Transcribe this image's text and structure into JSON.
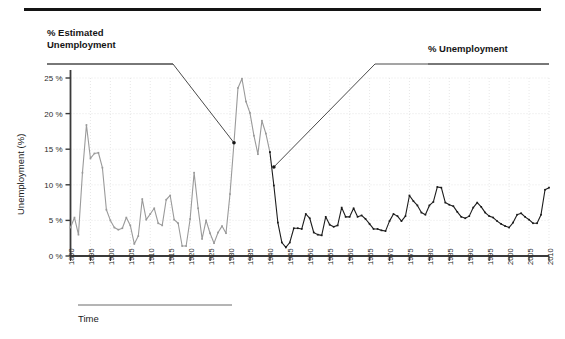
{
  "figure": {
    "annotations": {
      "left": {
        "name": "estimated-unemployment-callout",
        "text": "% Estimated\nUnemployment"
      },
      "right": {
        "name": "unemployment-callout",
        "text": "% Unemployment"
      }
    },
    "axis_titles": {
      "x": "Time",
      "y": "Unemployment (%)"
    },
    "colors": {
      "estimated_series": "#9a9a9a",
      "measured_series": "#1c1c1c",
      "axis": "#3a3a3a",
      "gridline": "#dcdcdc",
      "annotation_line": "#4a4a4a",
      "rule": "#141414"
    }
  },
  "chart_data": {
    "type": "line",
    "title": "",
    "subtitle": "",
    "xlabel": "Time",
    "ylabel": "Unemployment (%)",
    "xlim": [
      1890,
      2010
    ],
    "ylim": [
      0,
      25
    ],
    "grid": true,
    "legend_position": "annotations",
    "y_ticks": [
      "0 %",
      "5 %",
      "10 %",
      "15 %",
      "20 %",
      "25 %"
    ],
    "y_tick_values": [
      0,
      5,
      10,
      15,
      20,
      25
    ],
    "x_ticks": [
      "1890",
      "1895",
      "1900",
      "1905",
      "1910",
      "1915",
      "1920",
      "1925",
      "1930",
      "1935",
      "1940",
      "1945",
      "1950",
      "1955",
      "1960",
      "1965",
      "1970",
      "1975",
      "1980",
      "1985",
      "1990",
      "1995",
      "2000",
      "2005",
      "2010"
    ],
    "x_tick_values": [
      1890,
      1895,
      1900,
      1905,
      1910,
      1915,
      1920,
      1925,
      1930,
      1935,
      1940,
      1945,
      1950,
      1955,
      1960,
      1965,
      1970,
      1975,
      1980,
      1985,
      1990,
      1995,
      2000,
      2005,
      2010
    ],
    "series": [
      {
        "name": "% Estimated Unemployment",
        "color": "#9a9a9a",
        "x": [
          1890,
          1891,
          1892,
          1893,
          1894,
          1895,
          1896,
          1897,
          1898,
          1899,
          1900,
          1901,
          1902,
          1903,
          1904,
          1905,
          1906,
          1907,
          1908,
          1909,
          1910,
          1911,
          1912,
          1913,
          1914,
          1915,
          1916,
          1917,
          1918,
          1919,
          1920,
          1921,
          1922,
          1923,
          1924,
          1925,
          1926,
          1927,
          1928,
          1929,
          1930,
          1931,
          1932,
          1933,
          1934,
          1935,
          1936,
          1937,
          1938,
          1939,
          1940
        ],
        "values": [
          4.0,
          5.4,
          3.0,
          11.7,
          18.4,
          13.7,
          14.4,
          14.5,
          12.4,
          6.5,
          5.0,
          4.0,
          3.7,
          3.9,
          5.4,
          4.3,
          1.7,
          2.8,
          8.0,
          5.1,
          5.9,
          6.7,
          4.6,
          4.3,
          7.9,
          8.5,
          5.1,
          4.6,
          1.4,
          1.4,
          5.2,
          11.7,
          6.7,
          2.4,
          5.0,
          3.2,
          1.8,
          3.3,
          4.2,
          3.2,
          8.7,
          15.9,
          23.6,
          24.9,
          21.7,
          20.1,
          16.9,
          14.3,
          19.0,
          17.2,
          14.6
        ]
      },
      {
        "name": "% Unemployment",
        "color": "#1c1c1c",
        "x": [
          1940,
          1941,
          1942,
          1943,
          1944,
          1945,
          1946,
          1947,
          1948,
          1949,
          1950,
          1951,
          1952,
          1953,
          1954,
          1955,
          1956,
          1957,
          1958,
          1959,
          1960,
          1961,
          1962,
          1963,
          1964,
          1965,
          1966,
          1967,
          1968,
          1969,
          1970,
          1971,
          1972,
          1973,
          1974,
          1975,
          1976,
          1977,
          1978,
          1979,
          1980,
          1981,
          1982,
          1983,
          1984,
          1985,
          1986,
          1987,
          1988,
          1989,
          1990,
          1991,
          1992,
          1993,
          1994,
          1995,
          1996,
          1997,
          1998,
          1999,
          2000,
          2001,
          2002,
          2003,
          2004,
          2005,
          2006,
          2007,
          2008,
          2009,
          2010
        ],
        "values": [
          14.6,
          9.9,
          4.7,
          1.9,
          1.2,
          1.9,
          3.9,
          3.9,
          3.8,
          5.9,
          5.3,
          3.3,
          3.0,
          2.9,
          5.5,
          4.4,
          4.1,
          4.3,
          6.8,
          5.5,
          5.5,
          6.7,
          5.5,
          5.7,
          5.2,
          4.5,
          3.8,
          3.8,
          3.6,
          3.5,
          4.9,
          5.9,
          5.6,
          4.9,
          5.6,
          8.5,
          7.7,
          7.1,
          6.1,
          5.8,
          7.1,
          7.6,
          9.7,
          9.6,
          7.5,
          7.2,
          7.0,
          6.2,
          5.5,
          5.3,
          5.6,
          6.8,
          7.5,
          6.9,
          6.1,
          5.6,
          5.4,
          4.9,
          4.5,
          4.2,
          4.0,
          4.7,
          5.8,
          6.0,
          5.5,
          5.1,
          4.6,
          4.6,
          5.8,
          9.3,
          9.6
        ]
      }
    ],
    "annotations": [
      {
        "label": "% Estimated Unemployment",
        "points_to_year": 1931,
        "points_to_value": 15.9
      },
      {
        "label": "% Unemployment",
        "points_to_year": 1941,
        "points_to_value": 12.5
      }
    ]
  }
}
